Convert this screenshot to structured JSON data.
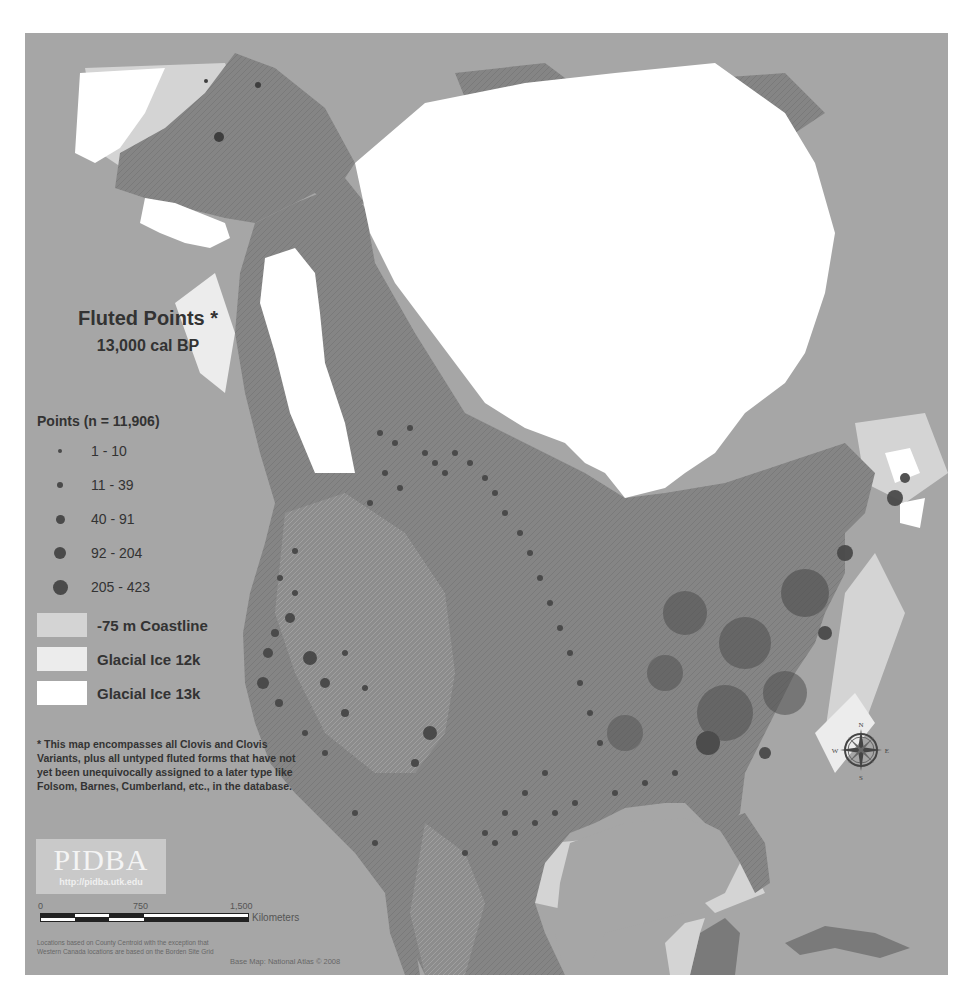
{
  "map": {
    "title": "Fluted Points *",
    "subtitle": "13,000 cal BP",
    "colors": {
      "ocean": "#a6a6a6",
      "coastline_75m": "#d4d4d4",
      "glacial_ice_12k": "#ececec",
      "glacial_ice_13k": "#ffffff",
      "land": "#858585",
      "land_dark": "#707070",
      "point": "#4a4a4a"
    }
  },
  "legend": {
    "points_title": "Points (n = 11,906)",
    "point_classes": [
      {
        "label": "1 - 10",
        "size": 4
      },
      {
        "label": "11 - 39",
        "size": 6
      },
      {
        "label": "40 - 91",
        "size": 9
      },
      {
        "label": "92 - 204",
        "size": 12
      },
      {
        "label": "205 - 423",
        "size": 15
      }
    ],
    "areas": [
      {
        "label": "-75 m Coastline",
        "color": "#d4d4d4"
      },
      {
        "label": "Glacial Ice 12k",
        "color": "#ececec"
      },
      {
        "label": "Glacial Ice 13k",
        "color": "#ffffff"
      }
    ]
  },
  "footnote": "* This map encompasses all Clovis and Clovis Variants, plus all untyped fluted forms that have not yet been unequivocally assigned to a later type like Folsom, Barnes, Cumberland, etc., in the database.",
  "branding": {
    "logo": "PIDBA",
    "url": "http://pidba.utk.edu"
  },
  "scale": {
    "ticks": [
      "0",
      "750",
      "1,500"
    ],
    "unit": "Kilometers"
  },
  "source_note": "Locations based on County Centroid with the exception that Western Canada locations are based on the Borden Site Grid",
  "basemap_credit": "Base Map: National Atlas © 2008",
  "compass": {
    "n": "N",
    "s": "S",
    "e": "E",
    "w": "W"
  }
}
